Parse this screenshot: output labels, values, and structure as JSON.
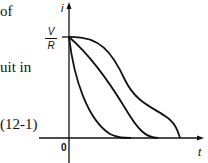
{
  "text_fragments": {
    "line1": "of",
    "line2": "uit in",
    "equation_number": "(12-1)"
  },
  "diagram": {
    "y_axis_label": "i",
    "x_axis_label": "t",
    "origin_label": "0",
    "start_label": {
      "numerator": "V",
      "denominator": "R"
    },
    "curves": [
      {
        "name": "fast-decay",
        "description": "concave-up decay from V/R reaching zero earliest"
      },
      {
        "name": "medium-decay",
        "description": "near-linear decay from V/R reaching zero in the middle"
      },
      {
        "name": "slow-decay",
        "description": "concave-down then concave-up decay from V/R reaching zero last"
      }
    ],
    "stroke_color": "#111111"
  }
}
